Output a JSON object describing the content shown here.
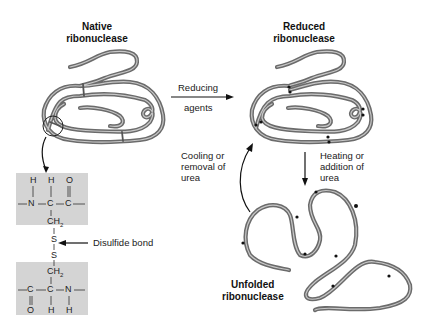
{
  "diagram": {
    "native": {
      "title_line1": "Native",
      "title_line2": "ribonuclease"
    },
    "reduced": {
      "title_line1": "Reduced",
      "title_line2": "ribonuclease"
    },
    "unfolded": {
      "title_line1": "Unfolded",
      "title_line2": "ribonuclease"
    },
    "arrow_reducing": {
      "line1": "Reducing",
      "line2": "agents"
    },
    "arrow_cooling": {
      "line1": "Cooling or",
      "line2": "removal of",
      "line3": "urea"
    },
    "arrow_heating": {
      "line1": "Heating or",
      "line2": "addition of",
      "line3": "urea"
    },
    "disulfide_label": "Disulfide bond",
    "chem_top": {
      "h1": "H",
      "h2": "H",
      "o": "O",
      "n": "N",
      "c1": "C",
      "c2": "C",
      "ch2": "CH",
      "sub2": "2"
    },
    "chem_s1": "S",
    "chem_s2": "S",
    "chem_bottom": {
      "ch2": "CH",
      "sub2": "2",
      "c1": "C",
      "c2": "C",
      "n": "N",
      "o": "O",
      "h1": "H",
      "h2": "H"
    },
    "colors": {
      "tube": "#6b6b6b",
      "tube_highlight": "#b5b5b5",
      "box": "#d4d4d4",
      "text": "#1a1a1a"
    }
  }
}
